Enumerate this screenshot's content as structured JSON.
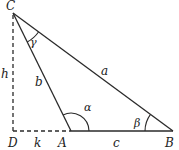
{
  "diagram": {
    "type": "triangle-geometry",
    "colors": {
      "stroke": "#2a2a2a",
      "text": "#222222",
      "background": "#ffffff"
    },
    "points": {
      "C": {
        "label": "C",
        "x": 13,
        "y": 13
      },
      "D": {
        "label": "D",
        "x": 13,
        "y": 131
      },
      "A": {
        "label": "A",
        "x": 71,
        "y": 131
      },
      "B": {
        "label": "B",
        "x": 173,
        "y": 131
      }
    },
    "sides": {
      "a": {
        "label": "a",
        "from": "C",
        "to": "B"
      },
      "b": {
        "label": "b",
        "from": "C",
        "to": "A"
      },
      "c": {
        "label": "c",
        "from": "A",
        "to": "B"
      },
      "h": {
        "label": "h",
        "from": "C",
        "to": "D",
        "style": "dashed"
      },
      "k": {
        "label": "k",
        "from": "D",
        "to": "A",
        "style": "dashed"
      }
    },
    "angles": {
      "alpha": {
        "label": "α",
        "vertex": "A"
      },
      "beta": {
        "label": "β",
        "vertex": "B"
      },
      "gamma": {
        "label": "γ",
        "vertex": "C"
      }
    },
    "right_angle": {
      "vertex": "D"
    }
  }
}
